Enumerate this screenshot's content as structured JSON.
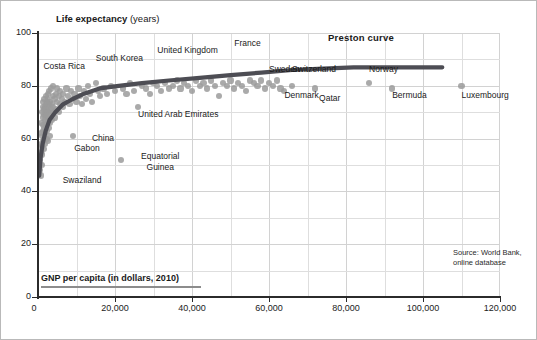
{
  "figure": {
    "source_note": "Source: World Bank,\nonline database",
    "source_line1": "Source: World Bank,",
    "source_line2": "online database"
  },
  "axes": {
    "y_title_main": "Life expectancy",
    "y_title_unit": "(years)",
    "x_title": "GNP per capita (in dollars, 2010)"
  },
  "chart_data": {
    "type": "scatter",
    "title": "",
    "subtitle": "",
    "xlabel": "GNP per capita (in dollars, 2010)",
    "ylabel": "Life expectancy (years)",
    "xlim": [
      0,
      120000
    ],
    "ylim": [
      0,
      100
    ],
    "xticks": [
      "0",
      "20,000",
      "40,000",
      "60,000",
      "80,000",
      "100,000",
      "120,000"
    ],
    "xtick_values": [
      0,
      20000,
      40000,
      60000,
      80000,
      100000,
      120000
    ],
    "yticks": [
      "0",
      "20",
      "40",
      "60",
      "80",
      "100"
    ],
    "ytick_values": [
      0,
      20,
      40,
      60,
      80,
      100
    ],
    "grid": true,
    "grid_minor_x": 10000,
    "grid_minor_y": 10,
    "legend": "none",
    "marker_color": "#9b9b9b",
    "curve_color": "#4d4d54",
    "annotations": [
      {
        "label": "Preston curve",
        "x": 77000,
        "y": 98,
        "bold": true
      },
      {
        "label": "Costa Rica",
        "x": 4000,
        "y": 87
      },
      {
        "label": "South Korea",
        "x": 15000,
        "y": 90
      },
      {
        "label": "United Kingdom",
        "x": 31000,
        "y": 93
      },
      {
        "label": "France",
        "x": 51000,
        "y": 96
      },
      {
        "label": "Sweden",
        "x": 60000,
        "y": 86
      },
      {
        "label": "Switzerland",
        "x": 66000,
        "y": 86
      },
      {
        "label": "Denmark",
        "x": 64000,
        "y": 76
      },
      {
        "label": "Qatar",
        "x": 73000,
        "y": 75
      },
      {
        "label": "Norway",
        "x": 86000,
        "y": 86
      },
      {
        "label": "Bermuda",
        "x": 92000,
        "y": 76
      },
      {
        "label": "Luxembourg",
        "x": 110000,
        "y": 76
      },
      {
        "label": "United Arab Emirates",
        "x": 26000,
        "y": 69
      },
      {
        "label": "China",
        "x": 14000,
        "y": 60
      },
      {
        "label": "Gabon",
        "x": 12000,
        "y": 56
      },
      {
        "label": "Swaziland",
        "x": 9000,
        "y": 44
      },
      {
        "label": "Equatorial Guinea",
        "x": 25000,
        "y": 53
      }
    ],
    "series": [
      {
        "name": "Countries",
        "points": [
          [
            500,
            48
          ],
          [
            600,
            52
          ],
          [
            700,
            46
          ],
          [
            700,
            58
          ],
          [
            800,
            55
          ],
          [
            800,
            62
          ],
          [
            900,
            50
          ],
          [
            900,
            66
          ],
          [
            1000,
            57
          ],
          [
            1000,
            70
          ],
          [
            1100,
            61
          ],
          [
            1100,
            54
          ],
          [
            1200,
            65
          ],
          [
            1200,
            72
          ],
          [
            1300,
            59
          ],
          [
            1300,
            68
          ],
          [
            1400,
            63
          ],
          [
            1400,
            74
          ],
          [
            1500,
            56
          ],
          [
            1500,
            69
          ],
          [
            1600,
            71
          ],
          [
            1600,
            60
          ],
          [
            1700,
            64
          ],
          [
            1700,
            75
          ],
          [
            1800,
            67
          ],
          [
            1800,
            58
          ],
          [
            1900,
            72
          ],
          [
            1900,
            62
          ],
          [
            2000,
            69
          ],
          [
            2000,
            76
          ],
          [
            2100,
            65
          ],
          [
            2100,
            73
          ],
          [
            2200,
            60
          ],
          [
            2200,
            70
          ],
          [
            2300,
            74
          ],
          [
            2300,
            66
          ],
          [
            2400,
            71
          ],
          [
            2400,
            63
          ],
          [
            2500,
            77
          ],
          [
            2500,
            68
          ],
          [
            2600,
            72
          ],
          [
            2600,
            59
          ],
          [
            2700,
            75
          ],
          [
            2700,
            67
          ],
          [
            2800,
            70
          ],
          [
            2800,
            64
          ],
          [
            2900,
            73
          ],
          [
            2900,
            78
          ],
          [
            3000,
            69
          ],
          [
            3000,
            61
          ],
          [
            3200,
            74
          ],
          [
            3200,
            66
          ],
          [
            3400,
            71
          ],
          [
            3400,
            79
          ],
          [
            3600,
            73
          ],
          [
            3600,
            67
          ],
          [
            3800,
            76
          ],
          [
            3800,
            70
          ],
          [
            4000,
            80
          ],
          [
            4000,
            72
          ],
          [
            4300,
            75
          ],
          [
            4300,
            68
          ],
          [
            4600,
            77
          ],
          [
            4600,
            71
          ],
          [
            5000,
            74
          ],
          [
            5000,
            79
          ],
          [
            5400,
            76
          ],
          [
            5400,
            70
          ],
          [
            5800,
            73
          ],
          [
            5800,
            78
          ],
          [
            6200,
            75
          ],
          [
            6600,
            72
          ],
          [
            6600,
            77
          ],
          [
            7000,
            74
          ],
          [
            7400,
            79
          ],
          [
            7800,
            76
          ],
          [
            8200,
            73
          ],
          [
            8600,
            78
          ],
          [
            9000,
            75
          ],
          [
            9000,
            61
          ],
          [
            9500,
            77
          ],
          [
            10000,
            74
          ],
          [
            10500,
            79
          ],
          [
            11000,
            76
          ],
          [
            11500,
            73
          ],
          [
            12000,
            78
          ],
          [
            12500,
            75
          ],
          [
            13000,
            80
          ],
          [
            13500,
            77
          ],
          [
            14000,
            74
          ],
          [
            15000,
            81
          ],
          [
            15500,
            78
          ],
          [
            16000,
            76
          ],
          [
            17000,
            79
          ],
          [
            18000,
            77
          ],
          [
            19000,
            80
          ],
          [
            20000,
            78
          ],
          [
            21500,
            52
          ],
          [
            22000,
            79
          ],
          [
            23000,
            77
          ],
          [
            24000,
            81
          ],
          [
            25000,
            78
          ],
          [
            26000,
            72
          ],
          [
            27000,
            80
          ],
          [
            28000,
            79
          ],
          [
            29000,
            77
          ],
          [
            30000,
            81
          ],
          [
            31000,
            80
          ],
          [
            32000,
            78
          ],
          [
            33000,
            81
          ],
          [
            34000,
            79
          ],
          [
            35000,
            80
          ],
          [
            36000,
            82
          ],
          [
            37000,
            79
          ],
          [
            38000,
            81
          ],
          [
            39000,
            80
          ],
          [
            40000,
            78
          ],
          [
            41000,
            82
          ],
          [
            42000,
            80
          ],
          [
            43000,
            81
          ],
          [
            44000,
            79
          ],
          [
            45000,
            82
          ],
          [
            46000,
            80
          ],
          [
            47000,
            76
          ],
          [
            48000,
            81
          ],
          [
            49000,
            80
          ],
          [
            50000,
            82
          ],
          [
            51000,
            79
          ],
          [
            52000,
            81
          ],
          [
            53000,
            80
          ],
          [
            54000,
            78
          ],
          [
            55000,
            82
          ],
          [
            56000,
            81
          ],
          [
            57000,
            80
          ],
          [
            58000,
            82
          ],
          [
            59000,
            79
          ],
          [
            60000,
            81
          ],
          [
            61000,
            80
          ],
          [
            62000,
            82
          ],
          [
            63000,
            79
          ],
          [
            64000,
            78
          ],
          [
            66000,
            80
          ],
          [
            72000,
            79
          ],
          [
            86000,
            81
          ],
          [
            92000,
            79
          ],
          [
            110000,
            80
          ]
        ]
      }
    ],
    "curve": {
      "name": "Preston curve",
      "points": [
        [
          300,
          46
        ],
        [
          700,
          53
        ],
        [
          1200,
          58
        ],
        [
          2000,
          63
        ],
        [
          3000,
          67
        ],
        [
          4500,
          70
        ],
        [
          6500,
          73
        ],
        [
          9000,
          75
        ],
        [
          12000,
          77
        ],
        [
          16000,
          79
        ],
        [
          21000,
          80
        ],
        [
          27000,
          81
        ],
        [
          34000,
          82
        ],
        [
          42000,
          83
        ],
        [
          50000,
          84
        ],
        [
          58000,
          85
        ],
        [
          66000,
          86
        ],
        [
          74000,
          86.5
        ],
        [
          82000,
          87
        ],
        [
          90000,
          87
        ],
        [
          100000,
          87
        ],
        [
          105000,
          87
        ]
      ]
    }
  }
}
